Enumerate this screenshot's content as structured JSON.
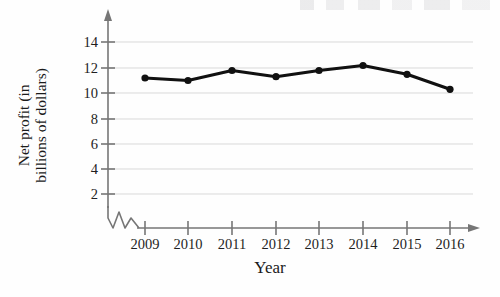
{
  "chart_data": {
    "type": "line",
    "title": "",
    "subtitle": "",
    "xlabel": "Year",
    "ylabel": "Net profit (in billions of dollars)",
    "ylabel_line1": "Net profit (in",
    "ylabel_line2": "billions of dollars)",
    "categories": [
      "2009",
      "2010",
      "2011",
      "2012",
      "2013",
      "2014",
      "2015",
      "2016"
    ],
    "x": [
      2009,
      2010,
      2011,
      2012,
      2013,
      2014,
      2015,
      2016
    ],
    "values": [
      11.2,
      11.0,
      11.8,
      11.3,
      11.8,
      12.2,
      11.5,
      10.3
    ],
    "series": [
      {
        "name": "Net profit",
        "values": [
          11.2,
          11.0,
          11.8,
          11.3,
          11.8,
          12.2,
          11.5,
          10.3
        ]
      }
    ],
    "ytick_labels": [
      "2",
      "4",
      "6",
      "8",
      "10",
      "12",
      "14"
    ],
    "yticks": [
      2,
      4,
      6,
      8,
      10,
      12,
      14
    ],
    "xtick_labels": [
      "2009",
      "2010",
      "2011",
      "2012",
      "2013",
      "2014",
      "2015",
      "2016"
    ],
    "ylim": [
      0,
      15
    ],
    "xlim": [
      2008.5,
      2016.8
    ],
    "grid": true,
    "grid_axis": "y",
    "legend": false,
    "legend_position": "none",
    "axis_break": true,
    "axis_break_note": "zigzag break symbol on axes near origin",
    "marker": "filled-circle",
    "line_color": "#111111",
    "marker_color": "#111111",
    "grid_color": "#d8d8d8",
    "axis_color": "#6e6e6e",
    "text_color": "#1b1b1b",
    "background": "#fefefe"
  }
}
